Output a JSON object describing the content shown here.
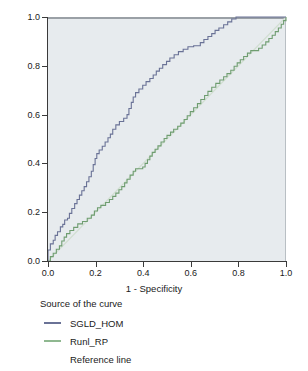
{
  "chart_data": {
    "type": "line",
    "title": "",
    "xlabel": "1 - Specificity",
    "ylabel": "Sensitivity",
    "xlim": [
      0,
      1
    ],
    "ylim": [
      0,
      1
    ],
    "grid": false,
    "legend_position": "below",
    "legend_title": "Source of the curve",
    "x_ticks": [
      "0.0",
      "0.2",
      "0.4",
      "0.6",
      "0.8",
      "1.0"
    ],
    "x_tick_values": [
      0.0,
      0.2,
      0.4,
      0.6,
      0.8,
      1.0
    ],
    "y_ticks": [
      "0.0",
      "0.2",
      "0.4",
      "0.6",
      "0.8",
      "1.0"
    ],
    "y_tick_values": [
      0.0,
      0.2,
      0.4,
      0.6,
      0.8,
      1.0
    ],
    "plot_background": "#e7ebee",
    "series": [
      {
        "name": "SGLD_HOM",
        "color": "#6a7296",
        "points": [
          [
            0.0,
            0.0
          ],
          [
            0.0,
            0.045
          ],
          [
            0.01,
            0.045
          ],
          [
            0.01,
            0.07
          ],
          [
            0.022,
            0.07
          ],
          [
            0.022,
            0.085
          ],
          [
            0.03,
            0.085
          ],
          [
            0.03,
            0.105
          ],
          [
            0.04,
            0.105
          ],
          [
            0.04,
            0.12
          ],
          [
            0.052,
            0.12
          ],
          [
            0.052,
            0.14
          ],
          [
            0.062,
            0.14
          ],
          [
            0.062,
            0.15
          ],
          [
            0.07,
            0.15
          ],
          [
            0.07,
            0.168
          ],
          [
            0.082,
            0.168
          ],
          [
            0.082,
            0.175
          ],
          [
            0.09,
            0.175
          ],
          [
            0.09,
            0.195
          ],
          [
            0.1,
            0.195
          ],
          [
            0.1,
            0.215
          ],
          [
            0.112,
            0.215
          ],
          [
            0.112,
            0.235
          ],
          [
            0.122,
            0.235
          ],
          [
            0.122,
            0.252
          ],
          [
            0.132,
            0.252
          ],
          [
            0.132,
            0.27
          ],
          [
            0.142,
            0.27
          ],
          [
            0.142,
            0.288
          ],
          [
            0.152,
            0.288
          ],
          [
            0.152,
            0.305
          ],
          [
            0.162,
            0.305
          ],
          [
            0.162,
            0.325
          ],
          [
            0.172,
            0.325
          ],
          [
            0.172,
            0.345
          ],
          [
            0.182,
            0.345
          ],
          [
            0.182,
            0.368
          ],
          [
            0.19,
            0.368
          ],
          [
            0.19,
            0.395
          ],
          [
            0.198,
            0.395
          ],
          [
            0.198,
            0.42
          ],
          [
            0.205,
            0.42
          ],
          [
            0.205,
            0.44
          ],
          [
            0.215,
            0.44
          ],
          [
            0.215,
            0.455
          ],
          [
            0.228,
            0.455
          ],
          [
            0.228,
            0.47
          ],
          [
            0.24,
            0.47
          ],
          [
            0.24,
            0.488
          ],
          [
            0.252,
            0.488
          ],
          [
            0.252,
            0.505
          ],
          [
            0.262,
            0.505
          ],
          [
            0.262,
            0.52
          ],
          [
            0.272,
            0.52
          ],
          [
            0.272,
            0.54
          ],
          [
            0.285,
            0.54
          ],
          [
            0.285,
            0.558
          ],
          [
            0.3,
            0.558
          ],
          [
            0.3,
            0.572
          ],
          [
            0.318,
            0.572
          ],
          [
            0.318,
            0.585
          ],
          [
            0.332,
            0.585
          ],
          [
            0.332,
            0.6
          ],
          [
            0.34,
            0.6
          ],
          [
            0.34,
            0.625
          ],
          [
            0.35,
            0.625
          ],
          [
            0.35,
            0.65
          ],
          [
            0.358,
            0.65
          ],
          [
            0.358,
            0.672
          ],
          [
            0.368,
            0.672
          ],
          [
            0.368,
            0.69
          ],
          [
            0.382,
            0.69
          ],
          [
            0.382,
            0.705
          ],
          [
            0.398,
            0.705
          ],
          [
            0.398,
            0.72
          ],
          [
            0.412,
            0.72
          ],
          [
            0.412,
            0.735
          ],
          [
            0.428,
            0.735
          ],
          [
            0.428,
            0.748
          ],
          [
            0.442,
            0.748
          ],
          [
            0.442,
            0.762
          ],
          [
            0.455,
            0.762
          ],
          [
            0.455,
            0.778
          ],
          [
            0.468,
            0.778
          ],
          [
            0.468,
            0.79
          ],
          [
            0.482,
            0.79
          ],
          [
            0.482,
            0.805
          ],
          [
            0.498,
            0.805
          ],
          [
            0.498,
            0.818
          ],
          [
            0.512,
            0.818
          ],
          [
            0.512,
            0.832
          ],
          [
            0.53,
            0.832
          ],
          [
            0.53,
            0.845
          ],
          [
            0.548,
            0.845
          ],
          [
            0.548,
            0.858
          ],
          [
            0.568,
            0.858
          ],
          [
            0.568,
            0.868
          ],
          [
            0.588,
            0.868
          ],
          [
            0.588,
            0.878
          ],
          [
            0.612,
            0.878
          ],
          [
            0.612,
            0.882
          ],
          [
            0.64,
            0.882
          ],
          [
            0.64,
            0.895
          ],
          [
            0.655,
            0.895
          ],
          [
            0.655,
            0.908
          ],
          [
            0.672,
            0.908
          ],
          [
            0.672,
            0.92
          ],
          [
            0.688,
            0.92
          ],
          [
            0.688,
            0.932
          ],
          [
            0.702,
            0.932
          ],
          [
            0.702,
            0.945
          ],
          [
            0.718,
            0.945
          ],
          [
            0.718,
            0.955
          ],
          [
            0.738,
            0.955
          ],
          [
            0.738,
            0.968
          ],
          [
            0.755,
            0.968
          ],
          [
            0.755,
            0.98
          ],
          [
            0.772,
            0.98
          ],
          [
            0.772,
            0.992
          ],
          [
            0.79,
            0.992
          ],
          [
            0.79,
            1.0
          ],
          [
            1.0,
            1.0
          ]
        ]
      },
      {
        "name": "Runl_RP",
        "color": "#6f9d70",
        "points": [
          [
            0.0,
            0.0
          ],
          [
            0.01,
            0.0
          ],
          [
            0.01,
            0.018
          ],
          [
            0.022,
            0.018
          ],
          [
            0.022,
            0.032
          ],
          [
            0.035,
            0.032
          ],
          [
            0.035,
            0.048
          ],
          [
            0.048,
            0.048
          ],
          [
            0.048,
            0.062
          ],
          [
            0.058,
            0.062
          ],
          [
            0.058,
            0.082
          ],
          [
            0.068,
            0.082
          ],
          [
            0.068,
            0.098
          ],
          [
            0.078,
            0.098
          ],
          [
            0.078,
            0.112
          ],
          [
            0.092,
            0.112
          ],
          [
            0.092,
            0.125
          ],
          [
            0.108,
            0.125
          ],
          [
            0.108,
            0.138
          ],
          [
            0.125,
            0.138
          ],
          [
            0.125,
            0.152
          ],
          [
            0.145,
            0.152
          ],
          [
            0.145,
            0.162
          ],
          [
            0.165,
            0.162
          ],
          [
            0.165,
            0.175
          ],
          [
            0.182,
            0.175
          ],
          [
            0.182,
            0.188
          ],
          [
            0.195,
            0.188
          ],
          [
            0.195,
            0.205
          ],
          [
            0.208,
            0.205
          ],
          [
            0.208,
            0.218
          ],
          [
            0.222,
            0.218
          ],
          [
            0.222,
            0.228
          ],
          [
            0.242,
            0.228
          ],
          [
            0.242,
            0.24
          ],
          [
            0.258,
            0.24
          ],
          [
            0.258,
            0.252
          ],
          [
            0.272,
            0.252
          ],
          [
            0.272,
            0.265
          ],
          [
            0.285,
            0.265
          ],
          [
            0.285,
            0.278
          ],
          [
            0.298,
            0.278
          ],
          [
            0.298,
            0.292
          ],
          [
            0.31,
            0.292
          ],
          [
            0.31,
            0.305
          ],
          [
            0.322,
            0.305
          ],
          [
            0.322,
            0.32
          ],
          [
            0.332,
            0.32
          ],
          [
            0.332,
            0.335
          ],
          [
            0.345,
            0.335
          ],
          [
            0.345,
            0.352
          ],
          [
            0.358,
            0.352
          ],
          [
            0.358,
            0.368
          ],
          [
            0.368,
            0.368
          ],
          [
            0.368,
            0.378
          ],
          [
            0.398,
            0.378
          ],
          [
            0.398,
            0.385
          ],
          [
            0.408,
            0.385
          ],
          [
            0.408,
            0.4
          ],
          [
            0.418,
            0.4
          ],
          [
            0.418,
            0.415
          ],
          [
            0.428,
            0.415
          ],
          [
            0.428,
            0.43
          ],
          [
            0.438,
            0.43
          ],
          [
            0.438,
            0.445
          ],
          [
            0.45,
            0.445
          ],
          [
            0.45,
            0.458
          ],
          [
            0.462,
            0.458
          ],
          [
            0.462,
            0.472
          ],
          [
            0.475,
            0.472
          ],
          [
            0.475,
            0.488
          ],
          [
            0.488,
            0.488
          ],
          [
            0.488,
            0.502
          ],
          [
            0.5,
            0.502
          ],
          [
            0.5,
            0.515
          ],
          [
            0.515,
            0.515
          ],
          [
            0.515,
            0.528
          ],
          [
            0.528,
            0.528
          ],
          [
            0.528,
            0.54
          ],
          [
            0.545,
            0.54
          ],
          [
            0.545,
            0.552
          ],
          [
            0.558,
            0.552
          ],
          [
            0.558,
            0.565
          ],
          [
            0.572,
            0.565
          ],
          [
            0.572,
            0.58
          ],
          [
            0.585,
            0.58
          ],
          [
            0.585,
            0.595
          ],
          [
            0.598,
            0.595
          ],
          [
            0.598,
            0.612
          ],
          [
            0.612,
            0.612
          ],
          [
            0.612,
            0.628
          ],
          [
            0.628,
            0.628
          ],
          [
            0.628,
            0.645
          ],
          [
            0.642,
            0.645
          ],
          [
            0.642,
            0.662
          ],
          [
            0.658,
            0.662
          ],
          [
            0.658,
            0.678
          ],
          [
            0.672,
            0.678
          ],
          [
            0.672,
            0.695
          ],
          [
            0.688,
            0.695
          ],
          [
            0.688,
            0.712
          ],
          [
            0.705,
            0.712
          ],
          [
            0.705,
            0.728
          ],
          [
            0.722,
            0.728
          ],
          [
            0.722,
            0.742
          ],
          [
            0.738,
            0.742
          ],
          [
            0.738,
            0.755
          ],
          [
            0.752,
            0.755
          ],
          [
            0.752,
            0.768
          ],
          [
            0.768,
            0.768
          ],
          [
            0.768,
            0.782
          ],
          [
            0.782,
            0.782
          ],
          [
            0.782,
            0.798
          ],
          [
            0.795,
            0.798
          ],
          [
            0.795,
            0.812
          ],
          [
            0.808,
            0.812
          ],
          [
            0.808,
            0.825
          ],
          [
            0.822,
            0.825
          ],
          [
            0.822,
            0.838
          ],
          [
            0.838,
            0.838
          ],
          [
            0.838,
            0.852
          ],
          [
            0.852,
            0.852
          ],
          [
            0.852,
            0.862
          ],
          [
            0.885,
            0.862
          ],
          [
            0.885,
            0.872
          ],
          [
            0.9,
            0.872
          ],
          [
            0.9,
            0.885
          ],
          [
            0.915,
            0.885
          ],
          [
            0.915,
            0.898
          ],
          [
            0.928,
            0.898
          ],
          [
            0.928,
            0.912
          ],
          [
            0.942,
            0.912
          ],
          [
            0.942,
            0.925
          ],
          [
            0.955,
            0.925
          ],
          [
            0.955,
            0.94
          ],
          [
            0.968,
            0.94
          ],
          [
            0.968,
            0.955
          ],
          [
            0.98,
            0.955
          ],
          [
            0.98,
            0.97
          ],
          [
            0.99,
            0.97
          ],
          [
            0.99,
            0.985
          ],
          [
            1.0,
            0.985
          ],
          [
            1.0,
            1.0
          ]
        ]
      },
      {
        "name": "Reference line",
        "color": "#d2dfd2",
        "points": [
          [
            0.0,
            0.0
          ],
          [
            1.0,
            1.0
          ]
        ]
      }
    ]
  },
  "axis": {
    "x_title": "1 - Specificity",
    "y_title": "Sensitivity"
  },
  "legend": {
    "title": "Source of the curve",
    "items": [
      {
        "label": "SGLD_HOM",
        "color": "#6a7296",
        "show_swatch": true
      },
      {
        "label": "Runl_RP",
        "color": "#8fb890",
        "show_swatch": true
      },
      {
        "label": "Reference line",
        "color": "#e3eae3",
        "show_swatch": false
      }
    ]
  }
}
